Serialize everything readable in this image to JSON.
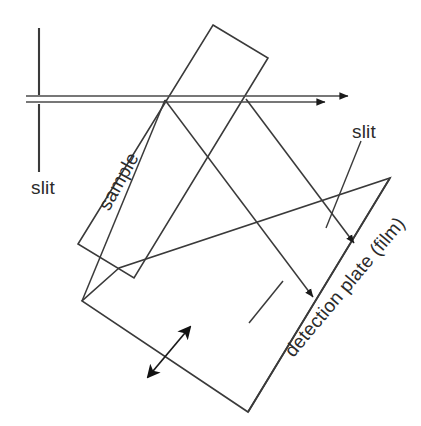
{
  "diagram": {
    "background_color": "#ffffff",
    "stroke_color": "#3a3a3a",
    "text_color": "#2b2b2b",
    "labels": {
      "slit_left": "slit",
      "slit_right": "slit",
      "sample": "sample",
      "detection_plate": "detection plate (film)"
    },
    "elements": {
      "slit_left_aperture": "vertical-slit-pair",
      "incident_beam": "double-line-beam-with-arrows",
      "sample_block": "tilted-rectangle",
      "detector_frame": "tilted-quadrilateral",
      "detection_plate_line": "diagonal-line",
      "diffracted_rays": "two-rays-with-arrowheads",
      "translation_arrow": "double-headed-arrow"
    }
  }
}
